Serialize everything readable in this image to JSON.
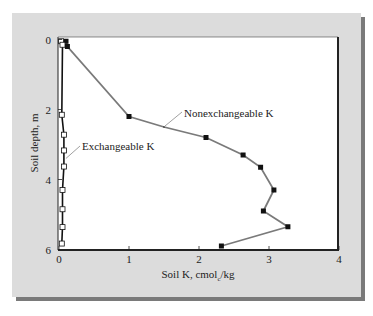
{
  "chart_data": {
    "type": "line",
    "title": "",
    "xlabel": "Soil K, cmol",
    "xlabel_sub": "c",
    "xlabel_suffix": "/kg",
    "ylabel": "Soil depth, m",
    "xlim": [
      0,
      4
    ],
    "ylim": [
      6,
      0
    ],
    "y_inverted": true,
    "x_ticks": [
      "0",
      "1",
      "2",
      "3",
      "4"
    ],
    "y_ticks": [
      "0",
      "2",
      "4",
      "6"
    ],
    "grid": false,
    "legend": "inline annotations",
    "series": [
      {
        "name": "Nonexchangeable K",
        "marker": "filled-square",
        "color": "#7a7a7a",
        "marker_color": "#111111",
        "points": [
          {
            "x": 0.1,
            "y": 0.05
          },
          {
            "x": 0.12,
            "y": 0.2
          },
          {
            "x": 1.0,
            "y": 2.2
          },
          {
            "x": 1.5,
            "y": 2.5
          },
          {
            "x": 2.1,
            "y": 2.8
          },
          {
            "x": 2.63,
            "y": 3.3
          },
          {
            "x": 2.88,
            "y": 3.65
          },
          {
            "x": 3.07,
            "y": 4.3
          },
          {
            "x": 2.92,
            "y": 4.9
          },
          {
            "x": 3.27,
            "y": 5.35
          },
          {
            "x": 2.32,
            "y": 5.9
          }
        ]
      },
      {
        "name": "Exchangeable K",
        "marker": "open-square",
        "color": "#111111",
        "marker_color": "#ffffff",
        "points": [
          {
            "x": 0.03,
            "y": 0.05
          },
          {
            "x": 0.05,
            "y": 0.15
          },
          {
            "x": 0.04,
            "y": 2.15
          },
          {
            "x": 0.07,
            "y": 2.72
          },
          {
            "x": 0.07,
            "y": 3.17
          },
          {
            "x": 0.07,
            "y": 3.63
          },
          {
            "x": 0.05,
            "y": 4.3
          },
          {
            "x": 0.05,
            "y": 4.85
          },
          {
            "x": 0.05,
            "y": 5.36
          },
          {
            "x": 0.04,
            "y": 5.83
          }
        ]
      }
    ],
    "annotations": [
      {
        "text": "Nonexchangeable K",
        "anchor": {
          "x": 1.5,
          "y": 2.5
        }
      },
      {
        "text": "Exchangeable K",
        "anchor": {
          "x": 0.07,
          "y": 3.4
        }
      }
    ]
  }
}
